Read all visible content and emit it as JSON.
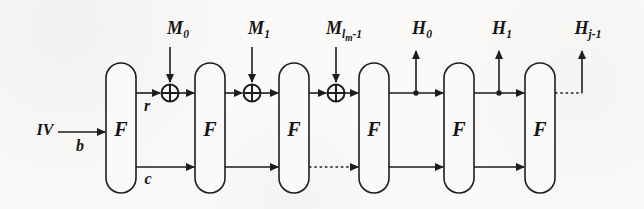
{
  "colors": {
    "background": "#fbfaf8",
    "line": "#1d1d1d",
    "text": "#161616"
  },
  "blocks": [
    {
      "label": "F"
    },
    {
      "label": "F"
    },
    {
      "label": "F"
    },
    {
      "label": "F"
    },
    {
      "label": "F"
    },
    {
      "label": "F"
    }
  ],
  "labels": {
    "iv": "IV",
    "b": "b",
    "r": "r",
    "c": "c",
    "m0": {
      "base": "M",
      "sub": "0"
    },
    "m1": {
      "base": "M",
      "sub": "1"
    },
    "mlm": {
      "base": "M",
      "sub_main": "l",
      "sub_sub": "m",
      "sub_tail": "-1"
    },
    "h0": {
      "base": "H",
      "sub": "0"
    },
    "h1": {
      "base": "H",
      "sub": "1"
    },
    "hj": {
      "base": "H",
      "sub": "j-1"
    }
  }
}
